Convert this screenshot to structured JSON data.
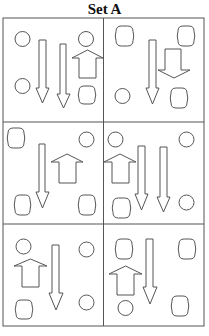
{
  "title": "Set A",
  "colors": {
    "stroke": "#555555",
    "border": "#555555",
    "fill": "#ffffff",
    "text": "#111111"
  },
  "grid": {
    "left": 3,
    "top": 18,
    "right": 204,
    "bottom": 326,
    "col_split": 103.5,
    "row_splits": [
      122,
      224
    ]
  },
  "panels": [
    {
      "id": 1,
      "circles": [
        {
          "cx": 22.5,
          "cy": 39,
          "r": 7.5
        },
        {
          "cx": 22.5,
          "cy": 86,
          "r": 7.5
        },
        {
          "cx": 86,
          "cy": 39,
          "r": 7.5
        }
      ],
      "barrels": [
        {
          "x": 79,
          "y": 86,
          "w": 16,
          "h": 18
        }
      ],
      "down_arrows": [
        {
          "sx": 39,
          "sw": 7,
          "sy": 40,
          "hy": 88,
          "hx": 36,
          "hw": 13,
          "ty": 103
        },
        {
          "sx": 60,
          "sw": 6,
          "sy": 44,
          "hy": 94,
          "hx": 57,
          "hw": 13,
          "ty": 108
        }
      ],
      "up_arrows": [
        {
          "hx": 72,
          "hw": 31,
          "ty": 50,
          "hy": 58,
          "sx": 79,
          "sw": 17,
          "by": 78
        }
      ]
    },
    {
      "id": 2,
      "circles": [
        {
          "cx": 122.5,
          "cy": 96,
          "r": 7.5
        }
      ],
      "barrels": [
        {
          "x": 116,
          "y": 26,
          "w": 17,
          "h": 20
        },
        {
          "x": 178,
          "y": 26,
          "w": 16,
          "h": 20
        },
        {
          "x": 171,
          "y": 88,
          "w": 16,
          "h": 20
        }
      ],
      "down_arrows": [
        {
          "sx": 149,
          "sw": 7,
          "sy": 40,
          "hy": 88,
          "hx": 146,
          "hw": 13,
          "ty": 104
        },
        {
          "sx": 165,
          "sw": 16,
          "sy": 49,
          "hy": 70,
          "hx": 158,
          "hw": 32,
          "ty": 78
        }
      ],
      "up_arrows": []
    },
    {
      "id": 3,
      "circles": [
        {
          "cx": 86.5,
          "cy": 139.5,
          "r": 7.5
        }
      ],
      "barrels": [
        {
          "x": 8,
          "y": 128,
          "w": 16,
          "h": 20
        },
        {
          "x": 15,
          "y": 195,
          "w": 15,
          "h": 20
        },
        {
          "x": 79,
          "y": 195,
          "w": 16,
          "h": 20
        }
      ],
      "down_arrows": [
        {
          "sx": 39,
          "sw": 6,
          "sy": 144,
          "hy": 192,
          "hx": 36,
          "hw": 13,
          "ty": 208
        }
      ],
      "up_arrows": [
        {
          "hx": 51,
          "hw": 32,
          "ty": 154,
          "hy": 162,
          "sx": 59,
          "sw": 17,
          "by": 183
        }
      ]
    },
    {
      "id": 4,
      "circles": [
        {
          "cx": 115.5,
          "cy": 139.5,
          "r": 7.5
        },
        {
          "cx": 186.5,
          "cy": 139.5,
          "r": 7.5
        },
        {
          "cx": 186.5,
          "cy": 202.5,
          "r": 7.5
        }
      ],
      "barrels": [
        {
          "x": 113,
          "y": 198,
          "w": 17,
          "h": 20
        }
      ],
      "down_arrows": [
        {
          "sx": 138,
          "sw": 7,
          "sy": 146,
          "hy": 194,
          "hx": 135,
          "hw": 13,
          "ty": 210
        },
        {
          "sx": 160,
          "sw": 7,
          "sy": 147,
          "hy": 197,
          "hx": 157,
          "hw": 13,
          "ty": 212
        }
      ],
      "up_arrows": [
        {
          "hx": 104,
          "hw": 32,
          "ty": 154,
          "hy": 162,
          "sx": 112,
          "sw": 17,
          "by": 183
        }
      ]
    },
    {
      "id": 5,
      "circles": [
        {
          "cx": 23.5,
          "cy": 246.5,
          "r": 7.5
        },
        {
          "cx": 86.5,
          "cy": 249.5,
          "r": 7.5
        },
        {
          "cx": 86.5,
          "cy": 302.5,
          "r": 7.5
        }
      ],
      "barrels": [
        {
          "x": 16,
          "y": 300,
          "w": 16,
          "h": 19
        }
      ],
      "down_arrows": [
        {
          "sx": 52,
          "sw": 7,
          "sy": 245,
          "hy": 293,
          "hx": 49,
          "hw": 14,
          "ty": 310
        }
      ],
      "up_arrows": [
        {
          "hx": 14,
          "hw": 33,
          "ty": 259,
          "hy": 266,
          "sx": 22,
          "sw": 17,
          "by": 287
        }
      ]
    },
    {
      "id": 6,
      "circles": [
        {
          "cx": 125.5,
          "cy": 308,
          "r": 7.5
        }
      ],
      "barrels": [
        {
          "x": 116,
          "y": 239,
          "w": 16,
          "h": 20
        },
        {
          "x": 179,
          "y": 239,
          "w": 16,
          "h": 20
        },
        {
          "x": 172,
          "y": 296,
          "w": 16,
          "h": 20
        }
      ],
      "down_arrows": [
        {
          "sx": 146,
          "sw": 7,
          "sy": 239,
          "hy": 287,
          "hx": 143,
          "hw": 14,
          "ty": 304
        }
      ],
      "up_arrows": [
        {
          "hx": 109,
          "hw": 33,
          "ty": 266,
          "hy": 274,
          "sx": 117,
          "sw": 17,
          "by": 295
        }
      ]
    }
  ]
}
